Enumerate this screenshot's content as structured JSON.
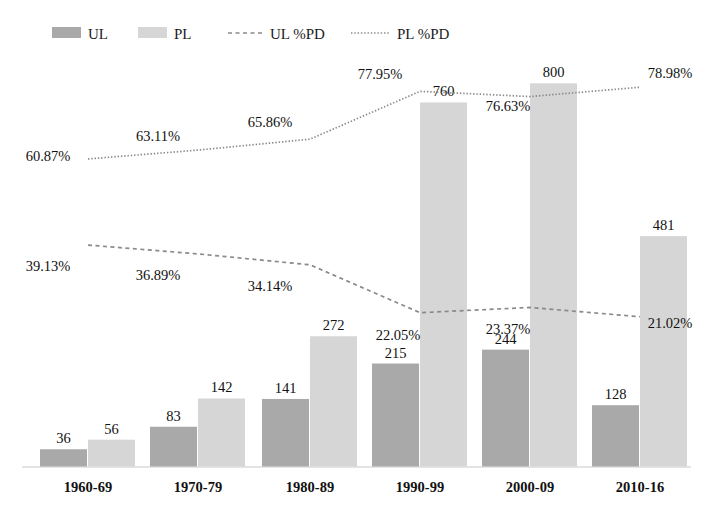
{
  "chart_data": {
    "type": "bar",
    "title": "",
    "xlabel": "",
    "ylabel": "",
    "grid": false,
    "legend_position": "top",
    "categories": [
      "1960-69",
      "1970-79",
      "1980-89",
      "1990-99",
      "2000-09",
      "2010-16"
    ],
    "ylim": [
      0,
      880
    ],
    "series": [
      {
        "name": "UL",
        "type": "bar",
        "color": "#a9a9a9",
        "values": [
          36,
          83,
          141,
          215,
          244,
          128
        ],
        "labels": [
          "36",
          "83",
          "141",
          "215",
          "244",
          "128"
        ]
      },
      {
        "name": "PL",
        "type": "bar",
        "color": "#d6d6d6",
        "values": [
          56,
          142,
          272,
          760,
          800,
          481
        ],
        "labels": [
          "56",
          "142",
          "272",
          "760",
          "800",
          "481"
        ]
      },
      {
        "name": "UL %PD",
        "type": "line",
        "style": "dashed",
        "color": "#8a8a8a",
        "values": [
          39.13,
          36.89,
          34.14,
          22.05,
          23.37,
          21.02
        ],
        "labels": [
          "39.13%",
          "36.89%",
          "34.14%",
          "22.05%",
          "23.37%",
          "21.02%"
        ]
      },
      {
        "name": "PL %PD",
        "type": "line",
        "style": "dotted",
        "color": "#8a8a8a",
        "values": [
          60.87,
          63.11,
          65.86,
          77.95,
          76.63,
          78.98
        ],
        "labels": [
          "60.87%",
          "63.11%",
          "65.86%",
          "77.95%",
          "76.63%",
          "78.98%"
        ]
      }
    ]
  },
  "legend": {
    "items": [
      {
        "label": "UL",
        "kind": "swatch",
        "color": "#a9a9a9"
      },
      {
        "label": "PL",
        "kind": "swatch",
        "color": "#d6d6d6"
      },
      {
        "label": "UL %PD",
        "kind": "dashed-line",
        "color": "#8a8a8a"
      },
      {
        "label": "PL %PD",
        "kind": "dotted-line",
        "color": "#8a8a8a"
      }
    ]
  },
  "axis": {
    "baseline_color": "#c9c9c9"
  }
}
